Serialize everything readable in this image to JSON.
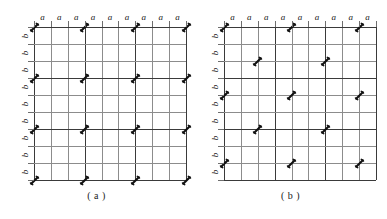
{
  "figure": {
    "background_color": "#ffffff",
    "grid_line_color": "#8c8c8c",
    "major_line_color": "#3a3a3a",
    "marker_color": "#111111"
  },
  "chart_data": {
    "type": "diagram",
    "title": "",
    "grid": {
      "columns": 9,
      "rows": 9,
      "column_label": "a",
      "row_label": "b",
      "major_line_interval": 3
    },
    "panels": [
      {
        "id": "a",
        "caption": "( a )",
        "top_labels": [
          "a",
          "a",
          "a",
          "a",
          "a",
          "a",
          "a",
          "a",
          "a"
        ],
        "left_labels": [
          "b",
          "b",
          "b",
          "b",
          "b",
          "b",
          "b",
          "b",
          "b"
        ],
        "pattern": "aligned",
        "markers": [
          {
            "col": 0,
            "row": 0
          },
          {
            "col": 3,
            "row": 0
          },
          {
            "col": 6,
            "row": 0
          },
          {
            "col": 9,
            "row": 0
          },
          {
            "col": 0,
            "row": 3
          },
          {
            "col": 3,
            "row": 3
          },
          {
            "col": 6,
            "row": 3
          },
          {
            "col": 9,
            "row": 3
          },
          {
            "col": 0,
            "row": 6
          },
          {
            "col": 3,
            "row": 6
          },
          {
            "col": 6,
            "row": 6
          },
          {
            "col": 9,
            "row": 6
          },
          {
            "col": 0,
            "row": 9
          },
          {
            "col": 3,
            "row": 9
          },
          {
            "col": 6,
            "row": 9
          },
          {
            "col": 9,
            "row": 9
          }
        ]
      },
      {
        "id": "b",
        "caption": "( b )",
        "top_labels": [
          "a",
          "a",
          "a",
          "a",
          "a",
          "a",
          "a",
          "a",
          "a"
        ],
        "left_labels": [
          "b",
          "b",
          "b",
          "b",
          "b",
          "b",
          "b",
          "b",
          "b"
        ],
        "pattern": "staggered",
        "markers": [
          {
            "col": 0,
            "row": 0
          },
          {
            "col": 4,
            "row": 0
          },
          {
            "col": 8,
            "row": 0
          },
          {
            "col": 2,
            "row": 2
          },
          {
            "col": 6,
            "row": 2
          },
          {
            "col": 0,
            "row": 4
          },
          {
            "col": 4,
            "row": 4
          },
          {
            "col": 8,
            "row": 4
          },
          {
            "col": 2,
            "row": 6
          },
          {
            "col": 6,
            "row": 6
          },
          {
            "col": 0,
            "row": 8
          },
          {
            "col": 4,
            "row": 8
          },
          {
            "col": 8,
            "row": 8
          }
        ]
      }
    ],
    "xlabel": "a",
    "ylabel": "b",
    "legend": []
  }
}
